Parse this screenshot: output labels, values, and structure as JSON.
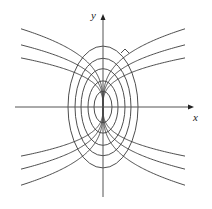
{
  "diagram": {
    "axes": {
      "x_label": "x",
      "y_label": "y",
      "origin_px": [
        103,
        107
      ],
      "x_range_px": [
        15,
        194
      ],
      "y_range_px": [
        14,
        197
      ]
    },
    "ellipse_family": {
      "equation": "x^2 + y^2/3 = c",
      "semi_axes_x_px": [
        9,
        15,
        22,
        28,
        35
      ],
      "vertical_ratio": 1.74
    },
    "trajectory_family": {
      "equation": "y = C x^(1/3)",
      "coefficients_px": [
        11.3,
        14.3,
        18.0
      ],
      "x_extent_px": 82
    },
    "right_angle_marker": {
      "position_px": [
        124,
        54
      ]
    },
    "colors": {
      "stroke": "#3a3a3a",
      "axis": "#555555",
      "background": "#ffffff"
    }
  }
}
